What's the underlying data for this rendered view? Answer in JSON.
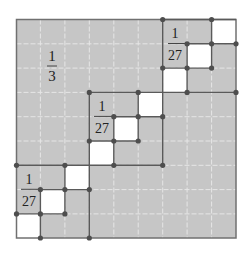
{
  "figure": {
    "grid_size": 9,
    "colors": {
      "fill": "#c6c6c6",
      "white": "#ffffff",
      "grid": "#e4e4e4",
      "frame": "#5a5a5a",
      "dot": "#4e4e4e",
      "text": "#222222"
    },
    "labels": {
      "big_fraction": {
        "numerator": "1",
        "denominator": "3"
      },
      "block_top_right": {
        "numerator": "1",
        "denominator": "27"
      },
      "block_middle": {
        "numerator": "1",
        "denominator": "27"
      },
      "block_bottom_left": {
        "numerator": "1",
        "denominator": "27"
      }
    }
  }
}
